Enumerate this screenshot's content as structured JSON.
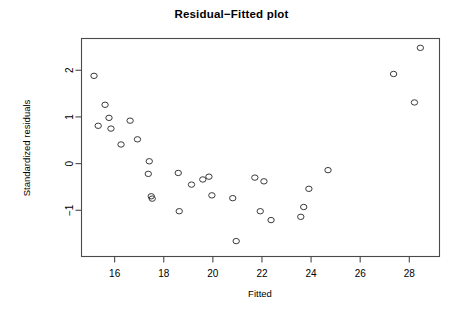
{
  "chart_data": {
    "type": "scatter",
    "title": "Residual−Fitted plot",
    "xlabel": "Fitted",
    "ylabel": "Standardized residuals",
    "xlim": [
      14.65,
      29.23
    ],
    "ylim": [
      -1.99,
      2.68
    ],
    "xticks": [
      16,
      18,
      20,
      22,
      24,
      26,
      28
    ],
    "xticklabels": [
      "16",
      "18",
      "20",
      "22",
      "24",
      "26",
      "28"
    ],
    "yticks": [
      2,
      1,
      0,
      -1
    ],
    "yticklabels": [
      "2",
      "1",
      "0",
      "−1"
    ],
    "grid": false,
    "legend": null,
    "marker": "open-circle",
    "marker_color": "#3a3a3a",
    "point_count": 35,
    "x": [
      15.16,
      15.61,
      15.77,
      15.33,
      15.85,
      16.63,
      16.26,
      16.93,
      17.41,
      17.37,
      17.49,
      18.63,
      19.13,
      19.59,
      19.96,
      20.12,
      20.25,
      18.59,
      18.75,
      19.84,
      20.81,
      21.71,
      22.08,
      22.37,
      23.58,
      23.7,
      23.91,
      22.25,
      20.95,
      24.69,
      27.36,
      28.21,
      28.45,
      17.53,
      21.93
    ],
    "y": [
      1.88,
      1.26,
      0.98,
      0.81,
      0.75,
      0.92,
      0.41,
      0.52,
      0.05,
      -0.22,
      -0.7,
      -0.2,
      -0.45,
      -0.34,
      -0.28,
      -0.3,
      -0.25,
      -1.02,
      -0.72,
      -0.68,
      -0.74,
      -0.3,
      -0.38,
      -1.21,
      -1.14,
      -0.93,
      -0.54,
      -1.03,
      -1.66,
      -0.14,
      1.92,
      1.31,
      2.48,
      -0.75,
      -1.02
    ],
    "points": [
      {
        "x": 15.16,
        "y": 1.88
      },
      {
        "x": 15.61,
        "y": 1.26
      },
      {
        "x": 15.77,
        "y": 0.98
      },
      {
        "x": 15.33,
        "y": 0.81
      },
      {
        "x": 15.85,
        "y": 0.75
      },
      {
        "x": 16.63,
        "y": 0.92
      },
      {
        "x": 16.26,
        "y": 0.41
      },
      {
        "x": 16.93,
        "y": 0.52
      },
      {
        "x": 17.41,
        "y": 0.05
      },
      {
        "x": 17.37,
        "y": -0.22
      },
      {
        "x": 17.49,
        "y": -0.7
      },
      {
        "x": 17.53,
        "y": -0.75
      },
      {
        "x": 18.59,
        "y": -0.2
      },
      {
        "x": 18.63,
        "y": -1.02
      },
      {
        "x": 19.13,
        "y": -0.45
      },
      {
        "x": 19.59,
        "y": -0.34
      },
      {
        "x": 19.84,
        "y": -0.28
      },
      {
        "x": 19.96,
        "y": -0.68
      },
      {
        "x": 20.81,
        "y": -0.74
      },
      {
        "x": 20.95,
        "y": -1.66
      },
      {
        "x": 21.71,
        "y": -0.3
      },
      {
        "x": 21.93,
        "y": -1.02
      },
      {
        "x": 22.08,
        "y": -0.38
      },
      {
        "x": 22.37,
        "y": -1.21
      },
      {
        "x": 23.58,
        "y": -1.14
      },
      {
        "x": 23.7,
        "y": -0.93
      },
      {
        "x": 23.91,
        "y": -0.54
      },
      {
        "x": 24.69,
        "y": -0.14
      },
      {
        "x": 27.36,
        "y": 1.92
      },
      {
        "x": 28.21,
        "y": 1.31
      },
      {
        "x": 28.45,
        "y": 2.48
      }
    ]
  },
  "plot": {
    "title": "Residual−Fitted plot",
    "x_axis_label": "Fitted",
    "y_axis_label": "Standardized residuals"
  }
}
